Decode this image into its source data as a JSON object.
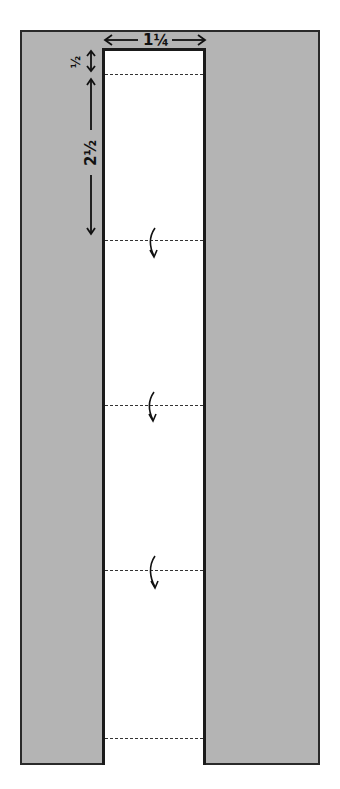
{
  "diagram": {
    "type": "fold-strip-template",
    "background_color": "#b4b4b4",
    "strip_color": "#ffffff",
    "dimensions": {
      "width_label": "1¼",
      "top_margin_label": "½",
      "section_label": "2½"
    },
    "fold_lines": [
      {
        "id": "fold-1",
        "y": 74,
        "has_arrow": false
      },
      {
        "id": "fold-2",
        "y": 240,
        "has_arrow": true
      },
      {
        "id": "fold-3",
        "y": 405,
        "has_arrow": true
      },
      {
        "id": "fold-4",
        "y": 570,
        "has_arrow": true
      },
      {
        "id": "fold-5",
        "y": 738,
        "has_arrow": false
      }
    ]
  }
}
